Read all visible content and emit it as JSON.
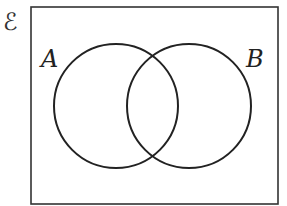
{
  "diagram": {
    "type": "venn",
    "universal_set_label": "ℰ",
    "sets": [
      {
        "label": "A",
        "cx": 116,
        "cy": 106,
        "r": 62
      },
      {
        "label": "B",
        "cx": 189,
        "cy": 106,
        "r": 62
      }
    ],
    "stroke_color": "#222222"
  }
}
